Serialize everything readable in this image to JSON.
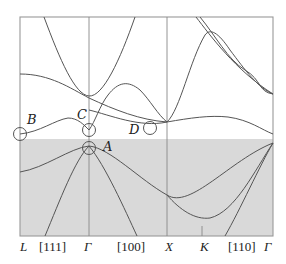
{
  "figure": {
    "type": "band-structure-diagram",
    "colors": {
      "background": "#ffffff",
      "valence_shading": "#d9d9d9",
      "curve": "#555555",
      "frame": "#999999"
    },
    "point_labels": {
      "A": "A",
      "B": "B",
      "C": "C",
      "D": "D"
    },
    "x_axis_labels": [
      {
        "text": "L",
        "italic": true
      },
      {
        "text": "[111]",
        "italic": false
      },
      {
        "text": "Γ",
        "italic": true
      },
      {
        "text": "[100]",
        "italic": false
      },
      {
        "text": "X",
        "italic": true
      },
      {
        "text": "K",
        "italic": true
      },
      {
        "text": "[110]",
        "italic": false
      },
      {
        "text": "Γ",
        "italic": true
      }
    ]
  }
}
